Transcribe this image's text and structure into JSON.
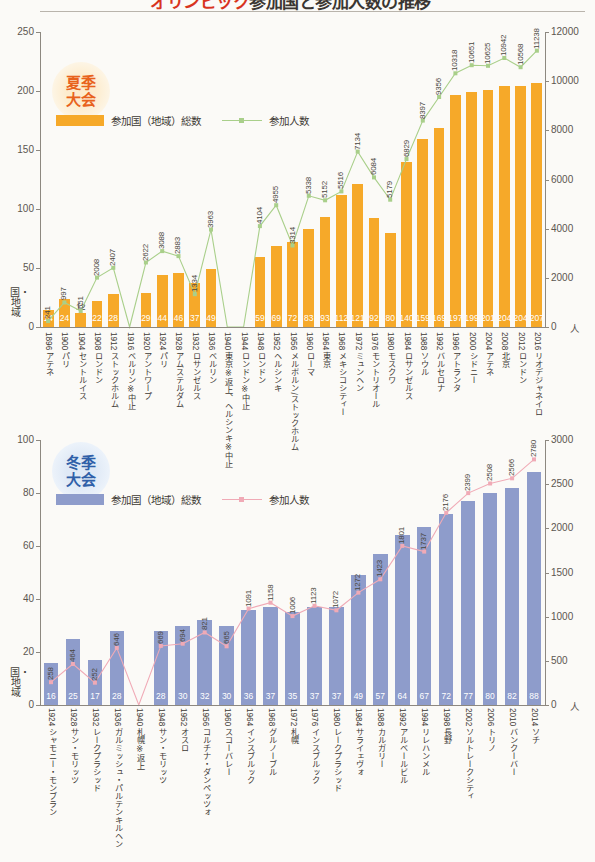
{
  "header": {
    "title_red": "オリンピック",
    "title_black": "参加国と参加人数の推移"
  },
  "summer": {
    "badge_line1": "夏季",
    "badge_line2": "大会",
    "legend_bar": "参加国（地域）総数",
    "legend_line": "参加人数",
    "bar_color": "#f6a929",
    "line_color": "#a9cf8a",
    "y_left_label": "国・地域",
    "y_left_ticks": [
      "250",
      "200",
      "150",
      "100",
      "50",
      "0"
    ],
    "y_right_ticks": [
      "12000",
      "10000",
      "8000",
      "6000",
      "4000",
      "2000",
      "0"
    ],
    "y_right_unit": "人"
  },
  "winter": {
    "badge_line1": "冬季",
    "badge_line2": "大会",
    "legend_bar": "参加国（地域）総数",
    "legend_line": "参加人数",
    "bar_color": "#8e9ccb",
    "line_color": "#f0aab6",
    "y_left_label": "国・地域",
    "y_left_ticks": [
      "100",
      "80",
      "60",
      "40",
      "20",
      "0"
    ],
    "y_right_ticks": [
      "3000",
      "2500",
      "2000",
      "1500",
      "1000",
      "500",
      "0"
    ],
    "y_right_unit": "人"
  },
  "chart_data": [
    {
      "type": "bar",
      "id": "summer-olympics",
      "title": "夏季大会",
      "xlabel": "",
      "ylabel": "国・地域",
      "y2label": "人",
      "ylim": [
        0,
        250
      ],
      "y2lim": [
        0,
        12000
      ],
      "grid": false,
      "legend": [
        "参加国（地域）総数",
        "参加人数"
      ],
      "categories": [
        "1896 アテネ",
        "1900 パリ",
        "1904 セントルイス",
        "1908 ロンドン",
        "1912 ストックホルム",
        "1916 ベルリン※中止",
        "1920 アントワープ",
        "1924 パリ",
        "1928 アムステルダム",
        "1932 ロサンゼルス",
        "1936 ベルリン",
        "1940 東京※返上、ヘルシンキ※中止",
        "1944 ロンドン※中止",
        "1948 ロンドン",
        "1952 ヘルシンキ",
        "1956 メルボルン/ストックホルム",
        "1960 ローマ",
        "1964 東京",
        "1968 メキシコシティー",
        "1972 ミュンヘン",
        "1976 モントリオール",
        "1980 モスクワ",
        "1984 ロサンゼルス",
        "1988 ソウル",
        "1992 バルセロナ",
        "1996 アトランタ",
        "2000 シドニー",
        "2004 アテネ",
        "2008 北京",
        "2012 ロンドン",
        "2016 リオデジャネイロ"
      ],
      "series": [
        {
          "name": "参加国（地域）総数",
          "kind": "bar",
          "axis": "left",
          "values": [
            14,
            24,
            12,
            22,
            28,
            0,
            29,
            44,
            46,
            37,
            49,
            0,
            0,
            59,
            69,
            72,
            83,
            93,
            112,
            121,
            92,
            80,
            140,
            159,
            169,
            197,
            199,
            201,
            204,
            204,
            207
          ]
        },
        {
          "name": "参加人数",
          "kind": "line",
          "axis": "right",
          "values": [
            241,
            997,
            651,
            2008,
            2407,
            0,
            2622,
            3088,
            2883,
            1334,
            3963,
            0,
            0,
            4104,
            4955,
            3314,
            5338,
            5152,
            5516,
            7134,
            6084,
            5179,
            6829,
            8397,
            9356,
            10318,
            10651,
            10625,
            10942,
            10568,
            11238
          ]
        }
      ]
    },
    {
      "type": "bar",
      "id": "winter-olympics",
      "title": "冬季大会",
      "xlabel": "",
      "ylabel": "国・地域",
      "y2label": "人",
      "ylim": [
        0,
        100
      ],
      "y2lim": [
        0,
        3000
      ],
      "grid": false,
      "legend": [
        "参加国（地域）総数",
        "参加人数"
      ],
      "categories": [
        "1924 シャモニー・モンブラン",
        "1928 サン・モリッツ",
        "1932 レークプラシッド",
        "1936 ガルミッシュ・パルテンキルヘン",
        "1940 札幌※返上",
        "1948 サン・モリッツ",
        "1952 オスロ",
        "1956 コルチナ・ダンペッツォ",
        "1960 スコーバレー",
        "1964 インスブルック",
        "1968 グルノーブル",
        "1972 札幌",
        "1976 インスブルック",
        "1980 レークプラシッド",
        "1984 サライェヴォ",
        "1988 カルガリー",
        "1992 アルベールビル",
        "1994 リレハンメル",
        "1998 長野",
        "2002 ソルトレークシティ",
        "2006 トリノ",
        "2010 バンクーバー",
        "2014 ソチ"
      ],
      "series": [
        {
          "name": "参加国（地域）総数",
          "kind": "bar",
          "axis": "left",
          "values": [
            16,
            25,
            17,
            28,
            0,
            28,
            30,
            32,
            30,
            36,
            37,
            35,
            37,
            37,
            49,
            57,
            64,
            67,
            72,
            77,
            80,
            82,
            88
          ]
        },
        {
          "name": "参加人数",
          "kind": "line",
          "axis": "right",
          "values": [
            258,
            464,
            252,
            646,
            0,
            669,
            694,
            821,
            665,
            1091,
            1158,
            1006,
            1123,
            1072,
            1272,
            1423,
            1801,
            1737,
            2176,
            2399,
            2508,
            2566,
            2780
          ]
        }
      ]
    }
  ]
}
